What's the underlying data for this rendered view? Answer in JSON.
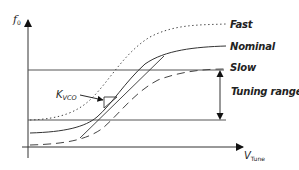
{
  "diagram": {
    "y_axis": {
      "label": "f",
      "label_subscript": "0"
    },
    "x_axis": {
      "label": "V",
      "label_subscript": "Tune"
    },
    "curves": [
      {
        "name": "Fast",
        "style": "dotted"
      },
      {
        "name": "Nominal",
        "style": "solid"
      },
      {
        "name": "Slow",
        "style": "dashed"
      }
    ],
    "annotations": {
      "kvco": {
        "label": "K",
        "label_subscript": "VCO"
      },
      "tuning_range": {
        "label": "Tuning range"
      }
    },
    "colors": {
      "line": "#3a3a3a",
      "text": "#222222",
      "background": "#ffffff"
    }
  }
}
